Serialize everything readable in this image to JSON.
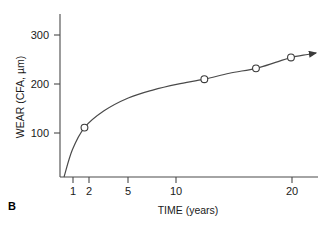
{
  "figure": {
    "panel_label": "B",
    "background_color": "#ffffff",
    "line_color": "#4a4a4a",
    "text_color": "#1a1a1a"
  },
  "chart_data": {
    "type": "line",
    "title": "",
    "subtitle": "",
    "xlabel": "TIME (years)",
    "ylabel": "WEAR (CFA, µm)",
    "x_scale": "log",
    "y_scale": "linear",
    "xlim": [
      0.72,
      23
    ],
    "ylim": [
      0,
      330
    ],
    "xticks": [
      1,
      2,
      5,
      10,
      20
    ],
    "xtick_labels": [
      "1",
      "2",
      "5",
      "10",
      "20"
    ],
    "yticks": [
      100,
      200,
      300
    ],
    "ytick_labels": [
      "100",
      "200",
      "300"
    ],
    "grid": false,
    "legend": null,
    "marker": "open-circle",
    "arrow_end": true,
    "series": [
      {
        "name": "Wear (CFA)",
        "x": [
          1,
          5,
          10,
          16
        ],
        "y": [
          100,
          198,
          220,
          242
        ],
        "marker_points": [
          {
            "x": 1,
            "y": 100
          },
          {
            "x": 5,
            "y": 198
          },
          {
            "x": 10,
            "y": 220
          },
          {
            "x": 16,
            "y": 242
          }
        ],
        "curve_points": [
          {
            "x": 0.76,
            "y": 0
          },
          {
            "x": 0.85,
            "y": 55
          },
          {
            "x": 1,
            "y": 100
          },
          {
            "x": 1.3,
            "y": 134
          },
          {
            "x": 1.8,
            "y": 160
          },
          {
            "x": 2.5,
            "y": 176
          },
          {
            "x": 3.5,
            "y": 188
          },
          {
            "x": 5,
            "y": 198
          },
          {
            "x": 7,
            "y": 210
          },
          {
            "x": 10,
            "y": 220
          },
          {
            "x": 13,
            "y": 232
          },
          {
            "x": 16,
            "y": 242
          },
          {
            "x": 20,
            "y": 248
          },
          {
            "x": 22.4,
            "y": 251
          }
        ]
      }
    ]
  },
  "axis": {
    "x_label_text": "TIME (years)",
    "y_label_text": "WEAR (CFA, µm)",
    "tick_300": "300",
    "tick_200": "200",
    "tick_100": "100",
    "tick_1": "1",
    "tick_2": "2",
    "tick_5": "5",
    "tick_10": "10",
    "tick_20": "20"
  }
}
